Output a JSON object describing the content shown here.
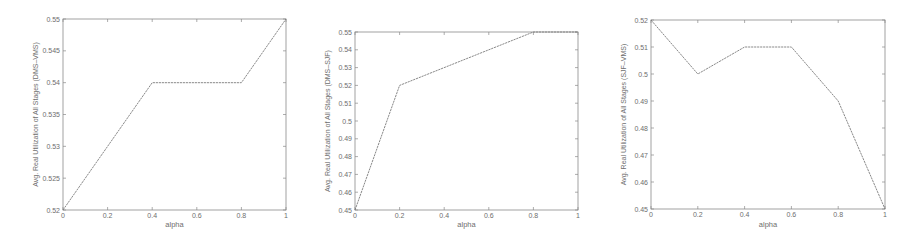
{
  "chart_data": [
    {
      "type": "line",
      "title": "",
      "xlabel": "alpha",
      "ylabel": "Avg. Real Utilization of All Stages (DMS–VMS)",
      "xlim": [
        0,
        1
      ],
      "ylim": [
        0.52,
        0.55
      ],
      "xticks": [
        "0",
        "0.2",
        "0.4",
        "0.6",
        "0.8",
        "1"
      ],
      "yticks": [
        "0.52",
        "0.525",
        "0.53",
        "0.535",
        "0.54",
        "0.545",
        "0.55"
      ],
      "grid": false,
      "x": [
        0,
        0.4,
        0.8,
        1
      ],
      "series": [
        {
          "name": "DMS-VMS",
          "values": [
            0.52,
            0.54,
            0.54,
            0.55
          ]
        }
      ]
    },
    {
      "type": "line",
      "title": "",
      "xlabel": "alpha",
      "ylabel": "Avg. Real Utilization of All Stages (DMS–SJF)",
      "xlim": [
        0,
        1
      ],
      "ylim": [
        0.45,
        0.55
      ],
      "xticks": [
        "0",
        "0.2",
        "0.4",
        "0.6",
        "0.8",
        "1"
      ],
      "yticks": [
        "0.45",
        "0.46",
        "0.47",
        "0.48",
        "0.49",
        "0.5",
        "0.51",
        "0.52",
        "0.53",
        "0.54",
        "0.55"
      ],
      "grid": false,
      "x": [
        0,
        0.2,
        0.8,
        1
      ],
      "series": [
        {
          "name": "DMS-SJF",
          "values": [
            0.45,
            0.52,
            0.55,
            0.55
          ]
        }
      ]
    },
    {
      "type": "line",
      "title": "",
      "xlabel": "alpha",
      "ylabel": "Avg. Real Utilization of All Stages (SJF–VMS)",
      "xlim": [
        0,
        1
      ],
      "ylim": [
        0.45,
        0.52
      ],
      "xticks": [
        "0",
        "0.2",
        "0.4",
        "0.6",
        "0.8",
        "1"
      ],
      "yticks": [
        "0.45",
        "0.46",
        "0.47",
        "0.48",
        "0.49",
        "0.5",
        "0.51",
        "0.52"
      ],
      "grid": false,
      "x": [
        0,
        0.2,
        0.4,
        0.6,
        0.8,
        1
      ],
      "series": [
        {
          "name": "SJF-VMS",
          "values": [
            0.52,
            0.5,
            0.51,
            0.51,
            0.49,
            0.45
          ]
        }
      ]
    }
  ],
  "layout": [
    {
      "left": 63,
      "top": 19,
      "right": 286,
      "bottom": 210
    },
    {
      "left": 355,
      "top": 32,
      "right": 578,
      "bottom": 210
    },
    {
      "left": 651,
      "top": 20,
      "right": 885,
      "bottom": 209
    }
  ],
  "colors": {
    "axis": "#8a8a8a",
    "line": "#7a7a7a",
    "text": "#6e6e6e"
  }
}
